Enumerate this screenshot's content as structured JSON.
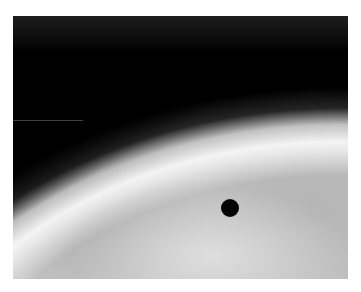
{
  "image": {
    "description": "Grayscale photograph of a planetary limb with bright atmospheric haze band against black space; a small black dot marker on the disk",
    "colors": {
      "space": "#000000",
      "limb_highlight": "#f5f5f5",
      "disk_gray": "#bdbdbd",
      "marker": "#050505",
      "frame": "#ffffff"
    },
    "elements": [
      "dark-space-region",
      "bright-limb-band",
      "planet-disk-haze",
      "black-dot-marker",
      "scan-line-artifact"
    ]
  }
}
